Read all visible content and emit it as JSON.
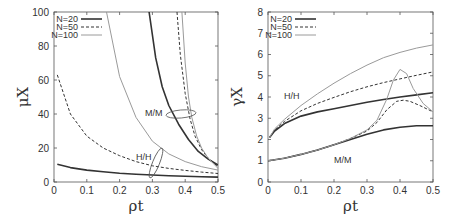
{
  "chart_data": [
    {
      "type": "line",
      "title": "",
      "xlabel": "ρt",
      "ylabel": "μX",
      "xlim": [
        0,
        0.5
      ],
      "ylim": [
        0,
        100
      ],
      "xticks": [
        "0",
        "0.1",
        "0.2",
        "0.3",
        "0.4",
        "0.5"
      ],
      "yticks": [
        "0",
        "20",
        "40",
        "60",
        "80",
        "100"
      ],
      "grid": false,
      "legend_position": "top-left",
      "legend": [
        "N=20",
        "N=50",
        "N=100"
      ],
      "annotations": [
        "M/M",
        "H/H"
      ],
      "series": [
        {
          "name": "N=20",
          "group": "H/H",
          "style": "solid",
          "x": [
            0.01,
            0.05,
            0.1,
            0.15,
            0.2,
            0.25,
            0.3,
            0.35,
            0.4,
            0.45,
            0.5
          ],
          "y": [
            10.5,
            8.5,
            7,
            6,
            5.2,
            4.6,
            4.1,
            3.7,
            3.4,
            3.1,
            2.9
          ]
        },
        {
          "name": "N=50",
          "group": "H/H",
          "style": "dashed",
          "x": [
            0.01,
            0.05,
            0.1,
            0.15,
            0.2,
            0.25,
            0.3,
            0.35,
            0.4,
            0.45,
            0.5
          ],
          "y": [
            63,
            40,
            27,
            20,
            15.5,
            12,
            9.5,
            8,
            6.8,
            5.8,
            5
          ]
        },
        {
          "name": "N=100",
          "group": "H/H",
          "style": "gray",
          "x": [
            0.16,
            0.2,
            0.25,
            0.3,
            0.35,
            0.4,
            0.45,
            0.5
          ],
          "y": [
            100,
            62,
            38,
            24,
            16.5,
            12,
            9,
            7
          ]
        },
        {
          "name": "N=20",
          "group": "M/M",
          "style": "solid",
          "x": [
            0.29,
            0.31,
            0.33,
            0.35,
            0.38,
            0.41,
            0.44,
            0.47,
            0.5
          ],
          "y": [
            100,
            73,
            56,
            45,
            34,
            25,
            18,
            13.5,
            10
          ]
        },
        {
          "name": "N=50",
          "group": "M/M",
          "style": "dashed",
          "x": [
            0.375,
            0.385,
            0.4,
            0.415,
            0.43,
            0.45,
            0.47,
            0.5
          ],
          "y": [
            100,
            75,
            52,
            37,
            27,
            19,
            14,
            9
          ]
        },
        {
          "name": "N=100",
          "group": "M/M",
          "style": "gray",
          "x": [
            0.39,
            0.4,
            0.41,
            0.42,
            0.435,
            0.45,
            0.47,
            0.5
          ],
          "y": [
            100,
            70,
            50,
            38,
            27,
            20,
            14,
            8
          ]
        }
      ]
    },
    {
      "type": "line",
      "title": "",
      "xlabel": "ρt",
      "ylabel": "γX",
      "xlim": [
        0,
        0.5
      ],
      "ylim": [
        0,
        8
      ],
      "xticks": [
        "0",
        "0.1",
        "0.2",
        "0.3",
        "0.4",
        "0.5"
      ],
      "yticks": [
        "0",
        "1",
        "2",
        "3",
        "4",
        "5",
        "6",
        "7",
        "8"
      ],
      "grid": false,
      "legend_position": "top-left",
      "legend": [
        "N=20",
        "N=50",
        "N=100"
      ],
      "annotations": [
        "H/H",
        "M/M"
      ],
      "series": [
        {
          "name": "N=20",
          "group": "H/H",
          "style": "solid",
          "x": [
            0.005,
            0.02,
            0.05,
            0.1,
            0.15,
            0.2,
            0.25,
            0.3,
            0.35,
            0.4,
            0.45,
            0.5
          ],
          "y": [
            2.1,
            2.4,
            2.75,
            3.1,
            3.3,
            3.45,
            3.6,
            3.75,
            3.88,
            4.0,
            4.1,
            4.2
          ]
        },
        {
          "name": "N=50",
          "group": "H/H",
          "style": "dashed",
          "x": [
            0.005,
            0.02,
            0.05,
            0.1,
            0.15,
            0.2,
            0.25,
            0.3,
            0.35,
            0.4,
            0.45,
            0.5
          ],
          "y": [
            2.1,
            2.45,
            2.85,
            3.35,
            3.7,
            3.98,
            4.25,
            4.48,
            4.68,
            4.85,
            5.02,
            5.18
          ]
        },
        {
          "name": "N=100",
          "group": "H/H",
          "style": "gray",
          "x": [
            0.005,
            0.02,
            0.05,
            0.1,
            0.15,
            0.2,
            0.25,
            0.3,
            0.35,
            0.4,
            0.45,
            0.5
          ],
          "y": [
            2.1,
            2.5,
            2.95,
            3.6,
            4.15,
            4.65,
            5.1,
            5.5,
            5.85,
            6.1,
            6.3,
            6.45
          ]
        },
        {
          "name": "N=20",
          "group": "M/M",
          "style": "solid",
          "x": [
            0,
            0.05,
            0.1,
            0.15,
            0.2,
            0.25,
            0.3,
            0.35,
            0.4,
            0.45,
            0.5
          ],
          "y": [
            1.0,
            1.12,
            1.3,
            1.5,
            1.75,
            2.0,
            2.25,
            2.45,
            2.58,
            2.65,
            2.65
          ]
        },
        {
          "name": "N=50",
          "group": "M/M",
          "style": "dashed",
          "x": [
            0,
            0.05,
            0.1,
            0.15,
            0.2,
            0.25,
            0.3,
            0.33,
            0.36,
            0.39,
            0.41,
            0.43,
            0.46,
            0.5
          ],
          "y": [
            1.0,
            1.12,
            1.3,
            1.5,
            1.75,
            2.05,
            2.4,
            2.8,
            3.4,
            3.8,
            3.85,
            3.8,
            3.6,
            3.3
          ]
        },
        {
          "name": "N=100",
          "group": "M/M",
          "style": "gray",
          "x": [
            0,
            0.05,
            0.1,
            0.15,
            0.2,
            0.25,
            0.3,
            0.33,
            0.36,
            0.38,
            0.4,
            0.42,
            0.44,
            0.47,
            0.5
          ],
          "y": [
            1.0,
            1.12,
            1.3,
            1.5,
            1.75,
            2.05,
            2.45,
            2.9,
            3.9,
            4.8,
            5.3,
            5.1,
            4.4,
            3.7,
            3.3
          ]
        }
      ]
    }
  ],
  "colors": {
    "solid": "#333333",
    "dashed": "#333333",
    "gray": "#9a9a9a",
    "axis": "#555555"
  }
}
